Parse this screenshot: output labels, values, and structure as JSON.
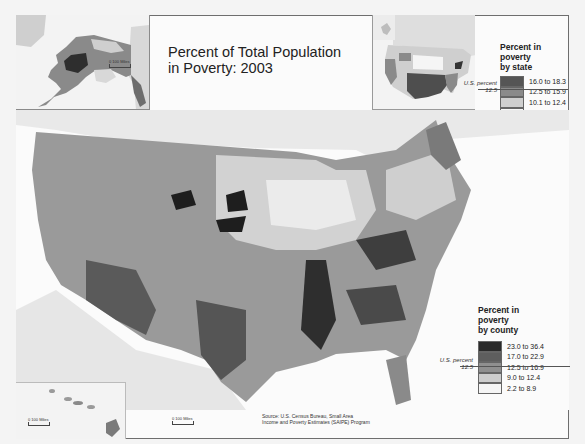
{
  "title": {
    "line1": "Percent of Total Population",
    "line2": "in Poverty: 2003"
  },
  "state_legend": {
    "title_lines": [
      "Percent in",
      "poverty",
      "by state"
    ],
    "classes": [
      {
        "label": "16.0 to 18.3",
        "color": "#555555"
      },
      {
        "label": "12.5 to 15.9",
        "color": "#8a8a8a"
      },
      {
        "label": "10.1 to 12.4",
        "color": "#cfcfcf"
      },
      {
        "label": "6.4 to 10.0",
        "color": "#f7f7f7"
      }
    ],
    "us_percent_label": "U.S. percent",
    "us_percent_value": "12.5"
  },
  "county_legend": {
    "title_lines": [
      "Percent in",
      "poverty",
      "by county"
    ],
    "classes": [
      {
        "label": "23.0 to 36.4",
        "color": "#2a2a2a"
      },
      {
        "label": "17.0 to 22.9",
        "color": "#5e5e5e"
      },
      {
        "label": "12.5 to 16.9",
        "color": "#8f8f8f"
      },
      {
        "label": "9.0 to 12.4",
        "color": "#cdcdcd"
      },
      {
        "label": "2.2 to 8.9",
        "color": "#f5f5f5"
      }
    ],
    "us_percent_label": "U.S. percent",
    "us_percent_value": "12.5"
  },
  "scales": {
    "alaska": "100 Miles",
    "hawaii": "100 Miles",
    "conus": "100 Miles",
    "zero": "0"
  },
  "source": {
    "line1": "Source: U.S. Census Bureau, Small Area",
    "line2": "Income and Poverty Estimates (SAIPE) Program"
  },
  "colors": {
    "land_outside": "#e6e6e6",
    "water": "#fbfbfb"
  }
}
